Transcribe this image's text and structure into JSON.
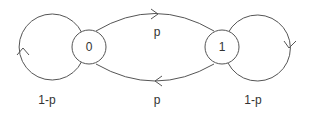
{
  "diagram": {
    "type": "markov-chain-state-transition",
    "colors": {
      "stroke": "#555555",
      "text": "#333333",
      "background": "#ffffff"
    },
    "nodes": [
      {
        "id": "0",
        "label": "0"
      },
      {
        "id": "1",
        "label": "1"
      }
    ],
    "edges": [
      {
        "from": "0",
        "to": "1",
        "label": "p"
      },
      {
        "from": "1",
        "to": "0",
        "label": "p"
      },
      {
        "from": "0",
        "to": "0",
        "label": "1-p"
      },
      {
        "from": "1",
        "to": "1",
        "label": "1-p"
      }
    ]
  }
}
